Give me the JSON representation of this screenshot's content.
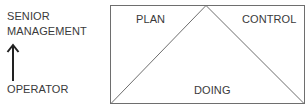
{
  "hierarchy": {
    "top_label_line1": "SENIOR",
    "top_label_line2": "MANAGEMENT",
    "bottom_label": "OPERATOR",
    "arrow": "up-arrow-icon"
  },
  "diagram": {
    "regions": {
      "left": "PLAN",
      "right": "CONTROL",
      "bottom": "DOING"
    },
    "colors": {
      "line": "#6e6e6e",
      "arrow": "#222222",
      "text": "#3a3a3a"
    }
  }
}
